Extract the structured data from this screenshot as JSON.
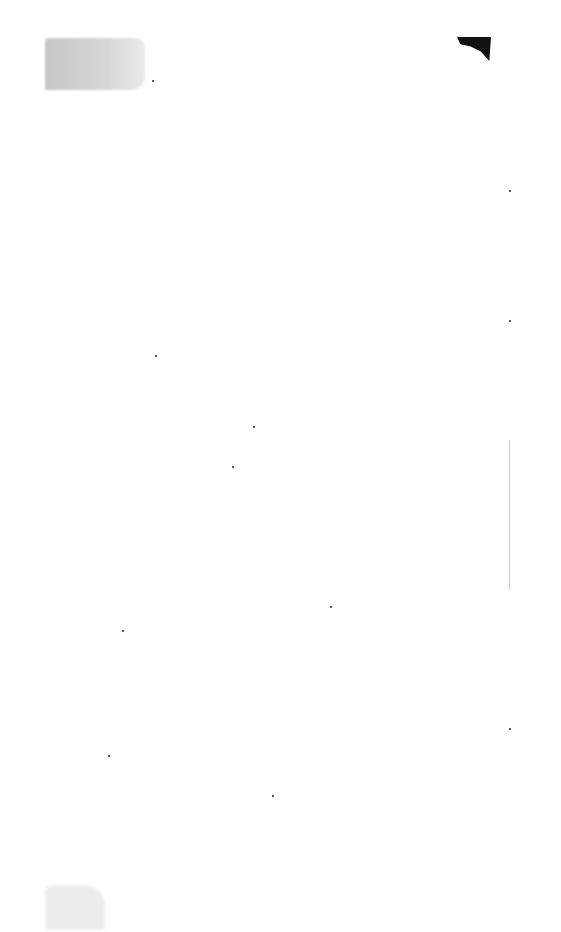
{
  "document": {
    "type": "scanned-blank-page",
    "text": "",
    "colors": {
      "background": "#ffffff",
      "smudge": "#c4c4c4",
      "blot": "#111111"
    }
  }
}
